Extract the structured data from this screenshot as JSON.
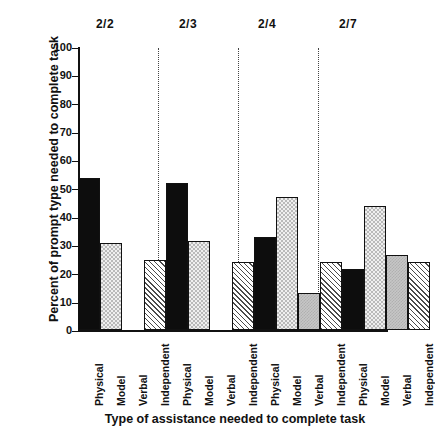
{
  "chart_data": {
    "type": "bar",
    "title": "",
    "xlabel": "Type of assistance needed to complete task",
    "ylabel": "Percent of prompt type needed to complete task",
    "ylim": [
      0,
      100
    ],
    "ytick_labels": [
      "100",
      "90",
      "80",
      "70",
      "60",
      "50",
      "40",
      "30",
      "20",
      "10",
      "0"
    ],
    "ytick_values": [
      100,
      90,
      80,
      70,
      60,
      50,
      40,
      30,
      20,
      10,
      0
    ],
    "grid": false,
    "legend_position": "none",
    "group_separator": "dotted-vertical-line",
    "categories": [
      "Physical",
      "Model",
      "Verbal",
      "Independent"
    ],
    "groups": [
      "2/2",
      "2/3",
      "2/4",
      "2/7"
    ],
    "series": [
      {
        "name": "Physical",
        "values": [
          54,
          52,
          33,
          21.5
        ]
      },
      {
        "name": "Model",
        "values": [
          31,
          31.5,
          47,
          44
        ]
      },
      {
        "name": "Verbal",
        "values": [
          0,
          0,
          13,
          26.5
        ]
      },
      {
        "name": "Independent",
        "values": [
          25,
          24,
          24,
          24
        ]
      }
    ],
    "bars": [
      {
        "group": "2/2",
        "category": "Physical",
        "value": 54,
        "pattern": "solid-black"
      },
      {
        "group": "2/2",
        "category": "Model",
        "value": 31,
        "pattern": "light-dotted"
      },
      {
        "group": "2/2",
        "category": "Verbal",
        "value": 0,
        "pattern": "solid-gray"
      },
      {
        "group": "2/2",
        "category": "Independent",
        "value": 25,
        "pattern": "diagonal-hatch"
      },
      {
        "group": "2/3",
        "category": "Physical",
        "value": 52,
        "pattern": "solid-black"
      },
      {
        "group": "2/3",
        "category": "Model",
        "value": 31.5,
        "pattern": "light-dotted"
      },
      {
        "group": "2/3",
        "category": "Verbal",
        "value": 0,
        "pattern": "solid-gray"
      },
      {
        "group": "2/3",
        "category": "Independent",
        "value": 24,
        "pattern": "diagonal-hatch"
      },
      {
        "group": "2/4",
        "category": "Physical",
        "value": 33,
        "pattern": "solid-black"
      },
      {
        "group": "2/4",
        "category": "Model",
        "value": 47,
        "pattern": "light-dotted"
      },
      {
        "group": "2/4",
        "category": "Verbal",
        "value": 13,
        "pattern": "solid-gray"
      },
      {
        "group": "2/4",
        "category": "Independent",
        "value": 24,
        "pattern": "diagonal-hatch"
      },
      {
        "group": "2/7",
        "category": "Physical",
        "value": 21.5,
        "pattern": "solid-black"
      },
      {
        "group": "2/7",
        "category": "Model",
        "value": 44,
        "pattern": "light-dotted"
      },
      {
        "group": "2/7",
        "category": "Verbal",
        "value": 26.5,
        "pattern": "solid-gray"
      },
      {
        "group": "2/7",
        "category": "Independent",
        "value": 24,
        "pattern": "diagonal-hatch"
      }
    ],
    "xtick_labels": [
      "Physical",
      "Model",
      "Verbal",
      "Independent",
      "Physical",
      "Model",
      "Verbal",
      "Independent",
      "Physical",
      "Model",
      "Verbal",
      "Independent",
      "Physical",
      "Model",
      "Verbal",
      "Independent"
    ],
    "colors": {
      "physical": "#0d0d0d",
      "model": "#efefef",
      "verbal": "#c6c6c6",
      "independent": "#ffffff",
      "axis": "#111111",
      "separator": "#444444"
    }
  }
}
